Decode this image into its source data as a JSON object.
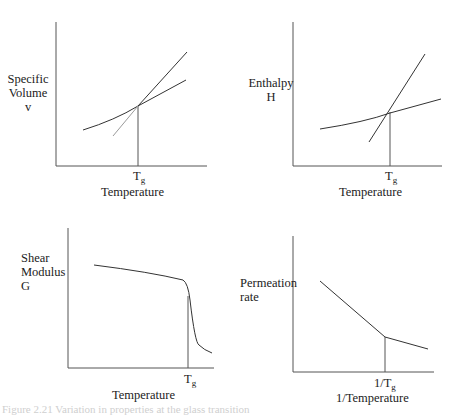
{
  "figure": {
    "caption": "Figure 2.21 Variation in properties at the glass transition"
  },
  "panels": [
    {
      "id": "specific-volume",
      "ylabel_lines": [
        "Specific",
        "Volume",
        "v"
      ],
      "tick": {
        "main": "T",
        "sub": "g"
      },
      "xlabel": "Temperature"
    },
    {
      "id": "enthalpy",
      "ylabel_lines": [
        "Enthalpy",
        "H"
      ],
      "tick": {
        "main": "T",
        "sub": "g"
      },
      "xlabel": "Temperature"
    },
    {
      "id": "shear-modulus",
      "ylabel_lines": [
        "Shear",
        "Modulus",
        "G"
      ],
      "tick": {
        "main": "T",
        "sub": "g"
      },
      "xlabel": "Temperature"
    },
    {
      "id": "permeation-rate",
      "ylabel_lines": [
        "Permeation",
        "rate"
      ],
      "tick": {
        "main": "1/T",
        "sub": "g"
      },
      "xlabel": "1/Temperature"
    }
  ],
  "colors": {
    "line": "#333333",
    "faint_line": "#9a9a9a",
    "axis": "#555555"
  }
}
